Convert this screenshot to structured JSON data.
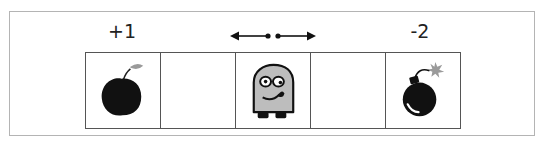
{
  "diagram": {
    "labels": [
      {
        "position": "cell-0",
        "text": "+1"
      },
      {
        "position": "cell-4",
        "text": "-2"
      }
    ],
    "cells": [
      {
        "index": 0,
        "content": "apple-icon"
      },
      {
        "index": 1,
        "content": "empty"
      },
      {
        "index": 2,
        "content": "robot-character-icon"
      },
      {
        "index": 3,
        "content": "empty"
      },
      {
        "index": 4,
        "content": "bomb-icon"
      }
    ],
    "movement": "left-right-arrows-icon",
    "colors": {
      "apple": "#111111",
      "leaf": "#9a9a9a",
      "robot_body": "#bdbdbd",
      "bomb": "#111111",
      "spark": "#9a9a9a",
      "grid_line": "#555555",
      "frame": "#b4b4b4"
    }
  }
}
